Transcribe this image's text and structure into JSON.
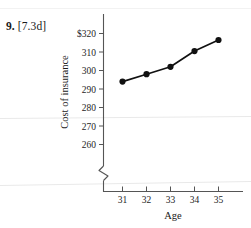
{
  "problem": {
    "number": "9.",
    "reference": "[7.3d]"
  },
  "chart_data": {
    "type": "line",
    "title": "",
    "xlabel": "Age",
    "ylabel": "Cost of insurance",
    "x": [
      31,
      32,
      33,
      34,
      35
    ],
    "values": [
      294,
      298,
      302,
      310.5,
      316.5
    ],
    "xtick_labels": [
      "31",
      "32",
      "33",
      "34",
      "35"
    ],
    "ytick_labels": [
      "$320",
      "310",
      "300",
      "290",
      "280",
      "270",
      "260"
    ],
    "ytick_values": [
      320,
      310,
      300,
      290,
      280,
      270,
      260
    ],
    "ylim": [
      255,
      322
    ],
    "xlim": [
      30.35,
      35.7
    ],
    "axis_break": true,
    "grid": false,
    "legend": "none",
    "marker": "filled-circle",
    "line_color": "#111111",
    "marker_color": "#111111"
  }
}
